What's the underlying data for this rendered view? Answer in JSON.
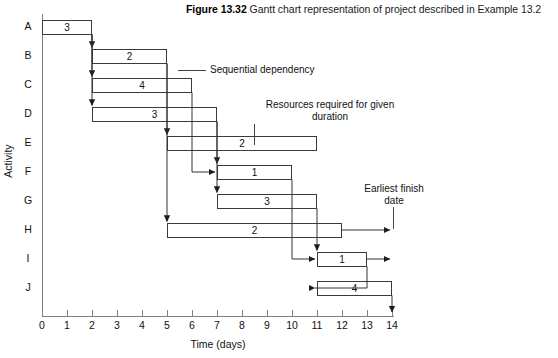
{
  "figure": {
    "number": "Figure 13.32",
    "caption": "Gantt chart representation of project described in Example 13.2"
  },
  "axes": {
    "x_title": "Time (days)",
    "y_title": "Activity",
    "x_ticks": [
      "0",
      "1",
      "2",
      "3",
      "4",
      "5",
      "6",
      "7",
      "8",
      "9",
      "10",
      "11",
      "12",
      "13",
      "14"
    ],
    "x_min": 0,
    "x_max": 14,
    "activities": [
      "A",
      "B",
      "C",
      "D",
      "E",
      "F",
      "G",
      "H",
      "I",
      "J"
    ]
  },
  "annotations": {
    "sequential_dependency": "Sequential dependency",
    "resources_line1": "Resources required for given",
    "resources_line2": "duration",
    "earliest_finish_line1": "Earliest  finish",
    "earliest_finish_line2": "date"
  },
  "colors": {
    "bar_border": "#3a3a3a",
    "bar_fill": "#ffffff",
    "axis": "#808080",
    "link": "#333333",
    "text": "#111111"
  },
  "chart_data": {
    "type": "bar",
    "title": "Gantt chart representation of project described in Example 13.2",
    "xlabel": "Time (days)",
    "ylabel": "Activity",
    "xlim": [
      0,
      14
    ],
    "grid": false,
    "orientation": "horizontal-gantt",
    "categories": [
      "A",
      "B",
      "C",
      "D",
      "E",
      "F",
      "G",
      "H",
      "I",
      "J"
    ],
    "tasks": [
      {
        "activity": "A",
        "start": 0,
        "end": 2,
        "duration": 2,
        "resources": "3"
      },
      {
        "activity": "B",
        "start": 2,
        "end": 5,
        "duration": 3,
        "resources": "2"
      },
      {
        "activity": "C",
        "start": 2,
        "end": 6,
        "duration": 4,
        "resources": "4"
      },
      {
        "activity": "D",
        "start": 2,
        "end": 7,
        "duration": 5,
        "resources": "3"
      },
      {
        "activity": "E",
        "start": 5,
        "end": 11,
        "duration": 6,
        "resources": "2"
      },
      {
        "activity": "F",
        "start": 7,
        "end": 10,
        "duration": 3,
        "resources": "1"
      },
      {
        "activity": "G",
        "start": 7,
        "end": 11,
        "duration": 4,
        "resources": "3"
      },
      {
        "activity": "H",
        "start": 5,
        "end": 12,
        "duration": 7,
        "resources": "2"
      },
      {
        "activity": "I",
        "start": 11,
        "end": 13,
        "duration": 2,
        "resources": "1"
      },
      {
        "activity": "J",
        "start": 11,
        "end": 14,
        "duration": 3,
        "resources": "4"
      }
    ],
    "float_arrows": [
      {
        "activity": "H",
        "from": 12,
        "to": 14
      },
      {
        "activity": "I",
        "from": 13,
        "to": 14
      }
    ],
    "dependencies": [
      {
        "from": "A",
        "to": "B"
      },
      {
        "from": "A",
        "to": "C"
      },
      {
        "from": "A",
        "to": "D"
      },
      {
        "from": "B",
        "to": "E"
      },
      {
        "from": "B",
        "to": "H"
      },
      {
        "from": "C",
        "to": "F"
      },
      {
        "from": "D",
        "to": "F"
      },
      {
        "from": "D",
        "to": "G"
      },
      {
        "from": "F",
        "to": "I"
      },
      {
        "from": "G",
        "to": "I"
      },
      {
        "from": "I",
        "to": "J"
      },
      {
        "from": "J",
        "to": "finish"
      }
    ]
  }
}
